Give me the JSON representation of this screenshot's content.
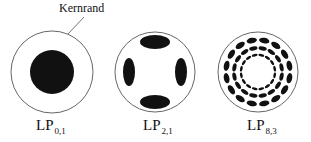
{
  "annotation": {
    "text": "Kernrand"
  },
  "modes": [
    {
      "name": "LP",
      "sub": "0,1",
      "cx": 52,
      "cy": 72,
      "r": 41
    },
    {
      "name": "LP",
      "sub": "2,1",
      "cx": 155,
      "cy": 72,
      "r": 40
    },
    {
      "name": "LP",
      "sub": "8,3",
      "cx": 258,
      "cy": 72,
      "r": 40
    }
  ],
  "colors": {
    "ink": "#111111",
    "outline": "#555555",
    "background": "#ffffff"
  }
}
